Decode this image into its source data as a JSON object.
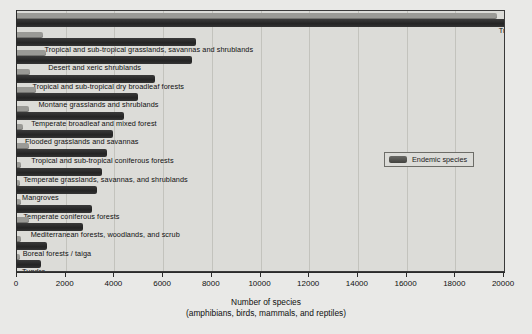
{
  "chart_data": {
    "type": "bar",
    "orientation": "horizontal",
    "title": "",
    "xlabel_line1": "Number of species",
    "xlabel_line2": "(amphibians, birds, mammals, and reptiles)",
    "ylabel": "",
    "xlim": [
      0,
      20000
    ],
    "xticks": [
      0,
      2000,
      4000,
      6000,
      8000,
      10000,
      12000,
      14000,
      16000,
      18000,
      20000
    ],
    "xticklabels": [
      "0",
      "2000",
      "4000",
      "6000",
      "8000",
      "10000",
      "12000",
      "14000",
      "16000",
      "18000",
      "20000"
    ],
    "grid": true,
    "legend": {
      "position": "center-right",
      "entries": [
        "Endemic species"
      ]
    },
    "categories": [
      "Tropical and sub-tropical broadleaf forests",
      "Tropical and sub-tropical grasslands, savannas and shrublands",
      "Desert and xeric shrublands",
      "Tropical and sub-tropical dry broadleaf forests",
      "Montane grasslands and shrublands",
      "Temperate broadleaf and mixed forest",
      "Flooded grasslands and savannas",
      "Tropical and sub-tropical coniferous forests",
      "Temperate grasslands, savannas, and shrublands",
      "Mangroves",
      "Temperate coniferous forests",
      "Mediterranean forests, woodlands, and scrub",
      "Boreal forests / taiga",
      "Tundra"
    ],
    "series": [
      {
        "name": "Total species",
        "color": "#2e2e2e",
        "values": [
          20100,
          7350,
          7200,
          5650,
          4950,
          4400,
          3950,
          3700,
          3500,
          3300,
          3100,
          2700,
          1250,
          1000
        ]
      },
      {
        "name": "Endemic species",
        "color": "#9a9a96",
        "values": [
          19700,
          1050,
          1200,
          550,
          800,
          500,
          250,
          500,
          180,
          120,
          180,
          480,
          150,
          120
        ]
      }
    ]
  },
  "legend": {
    "endemic_label": "Endemic species"
  },
  "axis": {
    "title_line1": "Number of species",
    "title_line2": "(amphibians, birds, mammals, and reptiles)"
  }
}
